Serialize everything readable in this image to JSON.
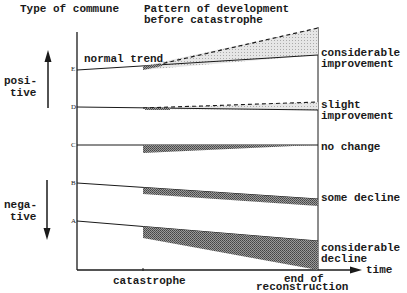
{
  "header": {
    "left": "Type of commune",
    "right_line1": "Pattern of development",
    "right_line2": "before catastrophe"
  },
  "side": {
    "positive_line1": "posi-",
    "positive_line2": "tive",
    "negative_line1": "nega-",
    "negative_line2": "tive"
  },
  "normal_trend_label": "normal trend",
  "commune_types": [
    {
      "key": "E",
      "outcome_line1": "considerable",
      "outcome_line2": "improvement"
    },
    {
      "key": "D",
      "outcome_line1": "slight",
      "outcome_line2": "improvement"
    },
    {
      "key": "C",
      "outcome_line1": "no change",
      "outcome_line2": ""
    },
    {
      "key": "B",
      "outcome_line1": "some decline",
      "outcome_line2": ""
    },
    {
      "key": "A",
      "outcome_line1": "considerable",
      "outcome_line2": "decline"
    }
  ],
  "x_axis": {
    "label": "time",
    "catastrophe": "catastrophe",
    "end_line1": "end of",
    "end_line2": "reconstruction"
  },
  "colors": {
    "ink": "#1a1a1a",
    "light_shade": "#d8d8d8",
    "dark_shade": "#7a7a7a"
  }
}
